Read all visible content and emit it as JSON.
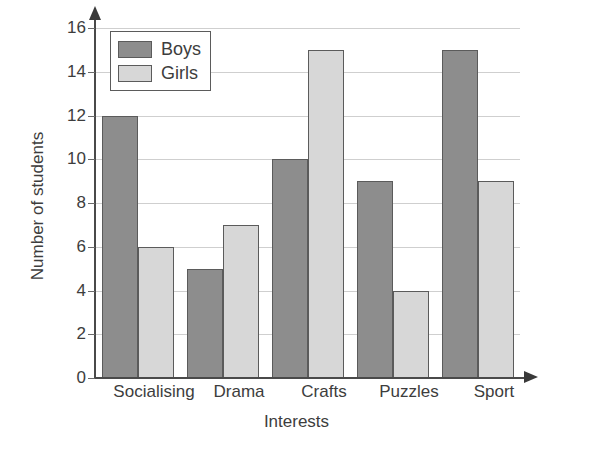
{
  "chart_data": {
    "type": "bar",
    "title": "",
    "subtitle": "",
    "xlabel": "Interests",
    "ylabel": "Number of students",
    "categories": [
      "Socialising",
      "Drama",
      "Crafts",
      "Puzzles",
      "Sport"
    ],
    "series": [
      {
        "name": "Boys",
        "color": "#8d8d8d",
        "values": [
          12,
          5,
          10,
          9,
          15
        ]
      },
      {
        "name": "Girls",
        "color": "#d7d7d7",
        "values": [
          6,
          7,
          15,
          4,
          9
        ]
      }
    ],
    "ylim": [
      0,
      16
    ],
    "y_ticks": [
      0,
      2,
      4,
      6,
      8,
      10,
      12,
      14,
      16
    ],
    "y_tick_labels": [
      "0",
      "2",
      "4",
      "6",
      "8",
      "10",
      "12",
      "14",
      "16"
    ],
    "grid": true,
    "grid_axis": "y",
    "legend_position": "top-left",
    "axis_arrows": true,
    "background": "#ffffff",
    "axis_color": "#4a4a4a",
    "grid_color": "#cfcfcf",
    "bar_border_color": "#5b5b5b"
  },
  "legend": {
    "entries": [
      {
        "label": "Boys",
        "swatch": "boys-swatch"
      },
      {
        "label": "Girls",
        "swatch": "girls-swatch"
      }
    ]
  },
  "axes": {
    "y_title": "Number of students",
    "x_title": "Interests"
  }
}
